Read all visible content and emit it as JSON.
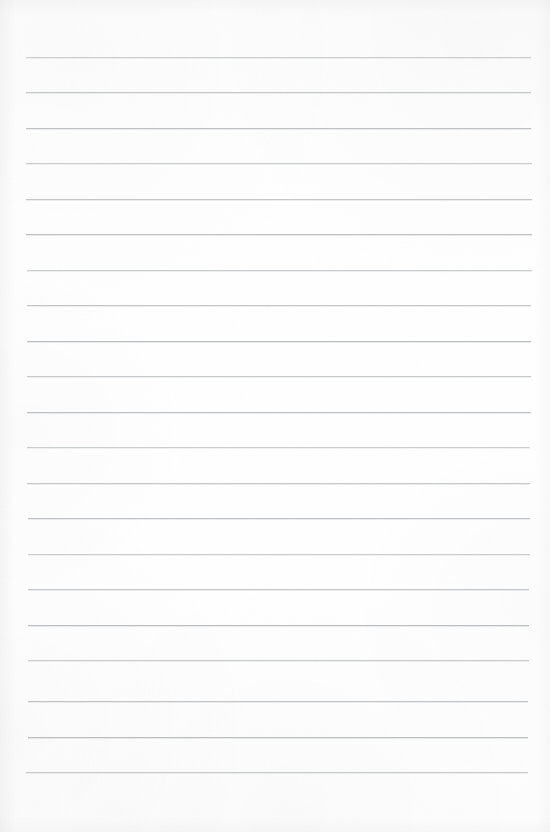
{
  "document": {
    "kind": "scanned-lined-paper",
    "page_width": 550,
    "page_height": 832,
    "paper_color": "#fefefe",
    "rule_color": "#b9bcbe",
    "text_content": "",
    "visible_text": []
  },
  "ruling": {
    "line_count": 21,
    "first_line_y": 57,
    "line_spacing": 35.5,
    "line_thickness": 1,
    "left_x": 26,
    "right_x": 531,
    "lines": [
      {
        "y": 57,
        "left": 26,
        "right": 531
      },
      {
        "y": 92,
        "left": 26,
        "right": 531
      },
      {
        "y": 128,
        "left": 26,
        "right": 531
      },
      {
        "y": 163,
        "left": 26,
        "right": 532
      },
      {
        "y": 199,
        "left": 26,
        "right": 532
      },
      {
        "y": 234,
        "left": 26,
        "right": 532
      },
      {
        "y": 270,
        "left": 27,
        "right": 532
      },
      {
        "y": 305,
        "left": 27,
        "right": 531
      },
      {
        "y": 341,
        "left": 27,
        "right": 531
      },
      {
        "y": 376,
        "left": 27,
        "right": 531
      },
      {
        "y": 412,
        "left": 27,
        "right": 531
      },
      {
        "y": 447,
        "left": 27,
        "right": 530
      },
      {
        "y": 483,
        "left": 27,
        "right": 530
      },
      {
        "y": 518,
        "left": 28,
        "right": 530
      },
      {
        "y": 554,
        "left": 28,
        "right": 530
      },
      {
        "y": 589,
        "left": 28,
        "right": 529
      },
      {
        "y": 625,
        "left": 28,
        "right": 529
      },
      {
        "y": 660,
        "left": 28,
        "right": 529
      },
      {
        "y": 701,
        "left": 28,
        "right": 528
      },
      {
        "y": 737,
        "left": 28,
        "right": 528
      },
      {
        "y": 772,
        "left": 26,
        "right": 528
      }
    ]
  },
  "margins": {
    "top_blank_height": 57,
    "bottom_blank_height": 60,
    "left_blank_width": 26,
    "right_blank_width": 19
  }
}
